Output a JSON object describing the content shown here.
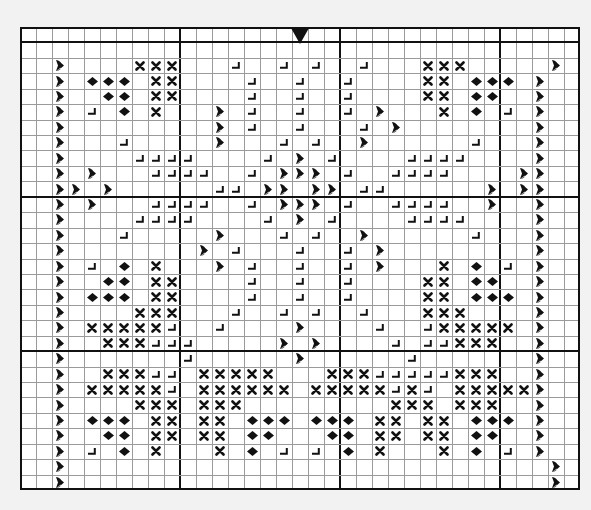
{
  "pattern": {
    "cols": 35,
    "rows": 30,
    "major_every": 10,
    "center_marker_col": 17,
    "legend": {
      "H": "heart-symbol",
      "X": "cross-symbol",
      "D": "diamond-symbol",
      "L": "corner-symbol"
    },
    "grid": [
      "...................................",
      "...................................",
      "..H....XXX...L..L.L..L...XXX.....H..",
      "..H.DDD.XX....L..L..L....XX.DDD.H..",
      "..H..DD.XX....L..L..L....XX.DD..H..",
      "..H.L.D.X...H.L..L..L.H...X.D.L.H..",
      "..H.........H.L..L...L.H........H..",
      "..H...L.....H...L.L..H......L...H..",
      "..H....LLLL....L.H.L....LLLL....H..",
      "..H.H...LLLL..L.HHH.L..LLLL....HH..",
      "..HH.H......LL.HH.HH.LL......H.HH..",
      "..H.H...LLLL..L.HHH.L..LLLL..H..H..",
      "..H....LLLL....L.H.L....LLLL....H..",
      "..H...L.....H...L.L..H......L...H..",
      "..H........H.L...L..L.H.........H..",
      "..H.L.D.X...H.L..L..L.H...X.D.L.H..",
      "..H..DD.XX....L..L..L....XX.DD..H..",
      "..H.DDD.XX....L..L..L....XX.DDD.H..",
      "..H....XXX...L..L.L..L...XXX....H..",
      "..H.XXXXXL..L....H....L..LXXXXX.H..",
      "..H..XXXLLL.....H.H....L.LLXXX..H..",
      "..H.......L......H......L.......H..",
      "..H..XXXLL.XXXXX...XXXLLLLLXXX..H..",
      "..H.XXXXXL.XXXXXX.XXXXXLXL.XXXXXH..",
      "..H....XXX.XXX.........XXX.XXX..H..",
      "..H.DDD.XX.XX.DDD.DDD.XX.XX.DDD.H..",
      "..H..DD.XX.XX.DD...DD.XX.XX.DD..H..",
      "..H.L.D.X...X.D.L.L.D.X...X.D.L.H..",
      "..H..............................H..",
      "..H..............................H.."
    ]
  }
}
